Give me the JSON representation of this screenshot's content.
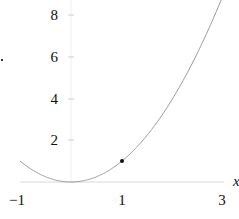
{
  "chart_data": {
    "type": "line",
    "title": "",
    "xlabel": "x",
    "ylabel": "",
    "xlim": [
      -1,
      3
    ],
    "ylim": [
      0,
      8.5
    ],
    "grid": false,
    "legend": null,
    "x_ticks": [
      -1,
      1,
      3
    ],
    "x_tick_labels": [
      "−1",
      "1",
      "3"
    ],
    "y_ticks": [
      2,
      4,
      6,
      8
    ],
    "y_tick_labels": [
      "2",
      "4",
      "6",
      "8"
    ],
    "series": [
      {
        "name": "y = x^2",
        "function": "x^2",
        "color": "#9a9a9a",
        "x": [
          -1,
          -0.5,
          0,
          0.5,
          1,
          1.5,
          2,
          2.5,
          2.9
        ],
        "y": [
          1,
          0.25,
          0,
          0.25,
          1,
          2.25,
          4,
          6.25,
          8.41
        ]
      }
    ],
    "points": [
      {
        "x": 1,
        "y": 1,
        "color": "#111111"
      }
    ],
    "colors": {
      "curve": "#9a9a9a",
      "axis": "#d8d8d8",
      "point": "#111111",
      "text": "#111111"
    }
  }
}
